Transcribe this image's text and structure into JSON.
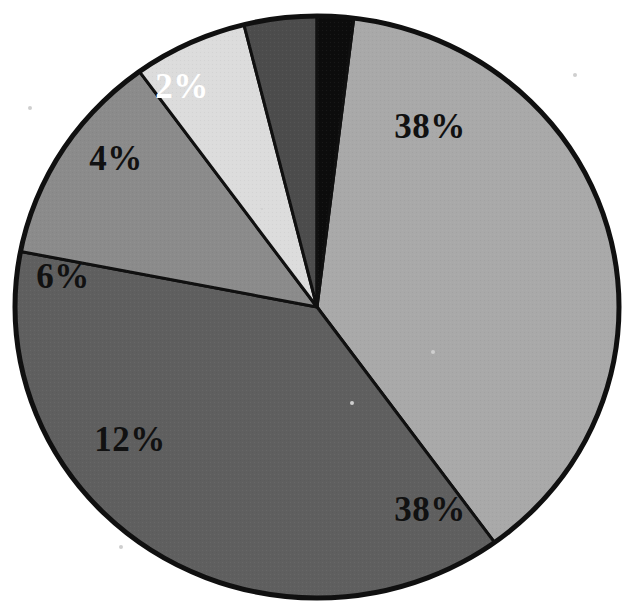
{
  "chart_data": {
    "type": "pie",
    "title": "",
    "subtitle": "",
    "xlabel": "",
    "ylabel": "",
    "legend_position": "none",
    "grid": false,
    "total": 100,
    "unit": "%",
    "categories": [
      "Segment 1",
      "Segment 2",
      "Segment 3",
      "Segment 4",
      "Segment 5",
      "Segment 6"
    ],
    "values": [
      38,
      38,
      12,
      6,
      4,
      2
    ],
    "labels": [
      "38%",
      "38%",
      "12%",
      "6%",
      "4%",
      "2%"
    ],
    "slices": [
      {
        "label": "38%",
        "value": 38,
        "fill": "#a9a9a9",
        "text_color": "#111111",
        "start_angle": -83,
        "end_angle": 54,
        "label_x": 430,
        "label_y": 130
      },
      {
        "label": "38%",
        "value": 38,
        "fill": "#5f5f5f",
        "text_color": "#111111",
        "start_angle": 54,
        "end_angle": 191,
        "label_x": 430,
        "label_y": 513
      },
      {
        "label": "12%",
        "value": 12,
        "fill": "#8b8b8b",
        "text_color": "#111111",
        "start_angle": 191,
        "end_angle": 234,
        "label_x": 130,
        "label_y": 443
      },
      {
        "label": "6%",
        "value": 6,
        "fill": "#dcdcdc",
        "text_color": "#111111",
        "start_angle": 234,
        "end_angle": 256,
        "label_x": 63,
        "label_y": 280
      },
      {
        "label": "4%",
        "value": 4,
        "fill": "#4c4c4c",
        "text_color": "#111111",
        "start_angle": 256,
        "end_angle": 270,
        "label_x": 116,
        "label_y": 162
      },
      {
        "label": "2%",
        "value": 2,
        "fill": "#0c0c0c",
        "text_color": "#ffffff",
        "start_angle": 270,
        "end_angle": 277,
        "label_x": 182,
        "label_y": 90
      }
    ],
    "geometry": {
      "cx": 317,
      "cy": 307,
      "rx": 302,
      "ry": 291,
      "stroke": "#101010",
      "stroke_width": 5
    }
  }
}
